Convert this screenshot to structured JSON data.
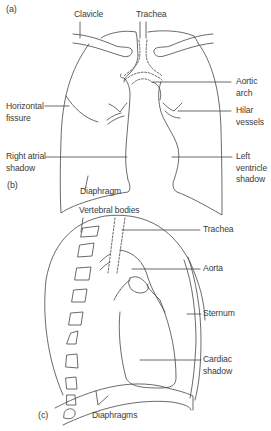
{
  "panels": {
    "a": {
      "tag": "(a)"
    },
    "b": {
      "tag": "(b)"
    },
    "c": {
      "tag": "(c)"
    }
  },
  "frontal_view": {
    "labels": {
      "clavicle": "Clavicle",
      "trachea": "Trachea",
      "aortic_arch": "Aortic\narch",
      "horizontal_fissure": "Horizontal\nfissure",
      "hilar_vessels": "Hilar\nvessels",
      "right_atrial_shadow": "Right atrial\nshadow",
      "left_ventricle_shadow": "Left\nventricle\nshadow",
      "diaphragm": "Diaphragm"
    }
  },
  "lateral_view": {
    "labels": {
      "vertebral_bodies": "Vertebral bodies",
      "trachea": "Trachea",
      "aorta": "Aorta",
      "sternum": "Sternum",
      "cardiac_shadow": "Cardiac\nshadow",
      "diaphragms": "Diaphragms"
    }
  },
  "style": {
    "line_color": "#444444",
    "text_color": "#3a3a3a"
  }
}
